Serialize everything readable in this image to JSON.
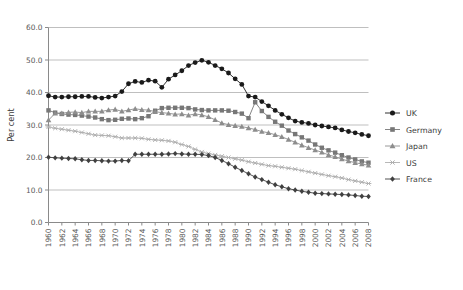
{
  "chart_data": {
    "type": "line",
    "title": "",
    "subtitle": "",
    "xlabel": "",
    "ylabel": "Per cent",
    "ylim": [
      0.0,
      60.0
    ],
    "yticks": [
      "0.0",
      "10.0",
      "20.0",
      "30.0",
      "40.0",
      "50.0",
      "60.0"
    ],
    "ytick_values": [
      0,
      10,
      20,
      30,
      40,
      50,
      60
    ],
    "grid": "horizontal",
    "legend_position": "right",
    "x": [
      1960,
      1961,
      1962,
      1963,
      1964,
      1965,
      1966,
      1967,
      1968,
      1969,
      1970,
      1971,
      1972,
      1973,
      1974,
      1975,
      1976,
      1977,
      1978,
      1979,
      1980,
      1981,
      1982,
      1983,
      1984,
      1985,
      1986,
      1987,
      1988,
      1989,
      1990,
      1991,
      1992,
      1993,
      1994,
      1995,
      1996,
      1997,
      1998,
      1999,
      2000,
      2001,
      2002,
      2003,
      2004,
      2005,
      2006,
      2007,
      2008
    ],
    "xtick_labels": [
      "1960",
      "1962",
      "1964",
      "1966",
      "1968",
      "1970",
      "1972",
      "1974",
      "1976",
      "1978",
      "1980",
      "1982",
      "1984",
      "1986",
      "1988",
      "1990",
      "1992",
      "1994",
      "1996",
      "1998",
      "2000",
      "2002",
      "2004",
      "2006",
      "2008"
    ],
    "xlim": [
      1960,
      2008
    ],
    "series": [
      {
        "name": "UK",
        "marker": "circle",
        "color": "#1a1a1a",
        "values": [
          39.0,
          38.6,
          38.6,
          38.7,
          38.7,
          38.8,
          38.8,
          38.5,
          38.3,
          38.6,
          38.9,
          40.3,
          42.7,
          43.4,
          43.1,
          43.8,
          43.5,
          41.6,
          44.1,
          45.4,
          46.7,
          48.3,
          49.2,
          49.9,
          49.3,
          48.3,
          47.3,
          46.0,
          44.2,
          42.5,
          38.9,
          38.6,
          37.2,
          35.9,
          34.5,
          33.3,
          32.2,
          31.2,
          30.8,
          30.5,
          30.0,
          29.7,
          29.4,
          29.1,
          28.5,
          28.0,
          27.6,
          27.1,
          26.7
        ]
      },
      {
        "name": "Germany",
        "marker": "square",
        "color": "#777777",
        "values": [
          34.5,
          33.8,
          33.4,
          33.2,
          33.1,
          32.9,
          32.6,
          32.3,
          31.8,
          31.5,
          31.6,
          31.9,
          32.0,
          31.8,
          32.1,
          32.7,
          34.4,
          35.2,
          35.3,
          35.3,
          35.3,
          35.2,
          34.8,
          34.6,
          34.5,
          34.5,
          34.5,
          34.4,
          34.0,
          33.5,
          32.1,
          37.0,
          34.3,
          32.5,
          31.0,
          29.8,
          28.3,
          27.2,
          26.2,
          25.2,
          24.0,
          23.0,
          22.2,
          21.5,
          20.7,
          20.0,
          19.4,
          18.8,
          18.4
        ]
      },
      {
        "name": "Japan",
        "marker": "triangle",
        "color": "#8d8d8d",
        "values": [
          31.5,
          33.6,
          33.6,
          33.9,
          34.0,
          33.8,
          34.2,
          34.2,
          34.2,
          34.6,
          34.8,
          34.2,
          34.6,
          35.0,
          34.7,
          34.6,
          34.1,
          33.8,
          33.6,
          33.3,
          33.4,
          33.0,
          33.4,
          33.1,
          32.5,
          31.6,
          30.6,
          30.1,
          29.8,
          29.5,
          29.1,
          28.6,
          28.0,
          27.6,
          27.0,
          26.4,
          25.5,
          24.7,
          23.8,
          23.0,
          22.3,
          21.6,
          20.8,
          20.2,
          19.5,
          18.9,
          18.4,
          18.0,
          17.6
        ]
      },
      {
        "name": "US",
        "marker": "star",
        "color": "#b0b0b0",
        "values": [
          29.4,
          29.0,
          28.7,
          28.4,
          28.1,
          27.7,
          27.3,
          26.9,
          26.8,
          26.7,
          26.4,
          26.0,
          26.0,
          26.0,
          25.9,
          25.6,
          25.4,
          25.3,
          25.1,
          24.7,
          24.0,
          23.4,
          22.5,
          21.7,
          21.2,
          20.8,
          20.4,
          20.0,
          19.6,
          19.2,
          18.7,
          18.3,
          17.9,
          17.5,
          17.3,
          17.0,
          16.7,
          16.4,
          16.0,
          15.6,
          15.2,
          14.8,
          14.4,
          14.1,
          13.7,
          13.2,
          12.8,
          12.4,
          12.0
        ]
      },
      {
        "name": "France",
        "marker": "diamond",
        "color": "#404040",
        "values": [
          20.1,
          19.9,
          19.8,
          19.7,
          19.6,
          19.3,
          19.1,
          19.1,
          19.0,
          18.9,
          18.9,
          19.1,
          19.0,
          21.0,
          21.0,
          21.0,
          21.0,
          21.0,
          21.1,
          21.2,
          21.1,
          21.0,
          21.0,
          20.9,
          20.6,
          20.0,
          19.1,
          18.1,
          17.0,
          16.0,
          15.0,
          14.0,
          13.2,
          12.4,
          11.6,
          11.0,
          10.4,
          10.0,
          9.6,
          9.3,
          9.0,
          8.9,
          8.8,
          8.7,
          8.6,
          8.5,
          8.3,
          8.1,
          8.0
        ]
      }
    ]
  },
  "legend": {
    "items": [
      {
        "label": "UK"
      },
      {
        "label": "Germany"
      },
      {
        "label": "Japan"
      },
      {
        "label": "US"
      },
      {
        "label": "France"
      }
    ]
  }
}
